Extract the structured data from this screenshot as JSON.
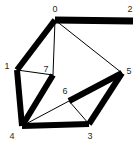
{
  "figure": {
    "title": "",
    "background_color": "#ffffff",
    "width": 138,
    "height": 145
  },
  "chart_data": {
    "type": "diagram",
    "subtype": "undirected-graph",
    "title": "",
    "xlabel": "",
    "ylabel": "",
    "grid": false,
    "legend": false,
    "edge_color": "#000000",
    "node_label_color": "#2b2b2b",
    "nodes": [
      {
        "id": "0",
        "label": "0",
        "x": 55,
        "y": 20,
        "label_x": 55,
        "label_y": 9
      },
      {
        "id": "1",
        "label": "1",
        "x": 17,
        "y": 70,
        "label_x": 7,
        "label_y": 66
      },
      {
        "id": "2",
        "label": "2",
        "x": 133,
        "y": 21,
        "label_x": 130,
        "label_y": 9
      },
      {
        "id": "3",
        "label": "3",
        "x": 89,
        "y": 124,
        "label_x": 90,
        "label_y": 136
      },
      {
        "id": "4",
        "label": "4",
        "x": 22,
        "y": 126,
        "label_x": 12,
        "label_y": 136
      },
      {
        "id": "5",
        "label": "5",
        "x": 122,
        "y": 73,
        "label_x": 129,
        "label_y": 71
      },
      {
        "id": "6",
        "label": "6",
        "x": 69,
        "y": 101,
        "label_x": 65,
        "label_y": 91
      },
      {
        "id": "7",
        "label": "7",
        "x": 53,
        "y": 75,
        "label_x": 46,
        "label_y": 69
      }
    ],
    "edges": [
      {
        "source": "0",
        "target": "2",
        "weight": "thick",
        "width": 7
      },
      {
        "source": "0",
        "target": "1",
        "weight": "thick",
        "width": 6
      },
      {
        "source": "1",
        "target": "4",
        "weight": "thick",
        "width": 6
      },
      {
        "source": "4",
        "target": "7",
        "weight": "thick",
        "width": 6
      },
      {
        "source": "4",
        "target": "3",
        "weight": "thick",
        "width": 6
      },
      {
        "source": "3",
        "target": "5",
        "weight": "thick",
        "width": 6
      },
      {
        "source": "5",
        "target": "6",
        "weight": "thick",
        "width": 6
      },
      {
        "source": "0",
        "target": "7",
        "weight": "thin",
        "width": 1
      },
      {
        "source": "0",
        "target": "5",
        "weight": "thin",
        "width": 1
      },
      {
        "source": "1",
        "target": "7",
        "weight": "thin",
        "width": 1
      },
      {
        "source": "4",
        "target": "6",
        "weight": "thin",
        "width": 1
      },
      {
        "source": "6",
        "target": "3",
        "weight": "thin",
        "width": 1
      }
    ]
  }
}
